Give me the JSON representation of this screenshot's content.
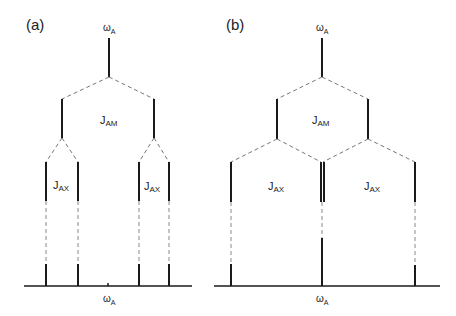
{
  "panels": [
    {
      "label": "(a)",
      "top_symbol": "ω",
      "top_sub": "A",
      "middle_symbol": "J",
      "middle_sub": "AM",
      "left_symbol": "J",
      "left_sub": "AX",
      "right_symbol": "J",
      "right_sub": "AX",
      "axis_symbol": "ω",
      "axis_sub": "A"
    },
    {
      "label": "(b)",
      "top_symbol": "ω",
      "top_sub": "A",
      "middle_symbol": "J",
      "middle_sub": "AM",
      "left_symbol": "J",
      "left_sub": "AX",
      "right_symbol": "J",
      "right_sub": "AX",
      "axis_symbol": "ω",
      "axis_sub": "A"
    }
  ],
  "colors": {
    "line": "#1a1a1a",
    "dash": "#666666"
  }
}
